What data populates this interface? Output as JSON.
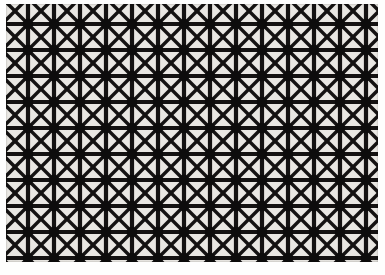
{
  "image": {
    "title": "Geometric lattice grille pattern",
    "subject": "repeating black star-and-grid lattice",
    "width": 385,
    "height": 275
  },
  "pattern": {
    "name": "square-grid-with-diagonals",
    "description": "Black lattice of square cells; every cell is crossed by both diagonals and bounded by orthogonal bars, forming eight-ray starburst nodes at each grid intersection.",
    "cell_size": 26,
    "columns": 15,
    "rows": 11,
    "bar_width": 4.2,
    "diagonal_width": 3.4,
    "node_radius": 5.2,
    "origin_x": -4,
    "origin_y": -6
  },
  "colors": {
    "lattice": "#141212",
    "cell_background": "#e9e7e3",
    "paper": "#fefefe",
    "node": "#0d0c0c"
  },
  "margins": {
    "left": 6,
    "top": 4,
    "right": 7,
    "bottom": 13
  }
}
